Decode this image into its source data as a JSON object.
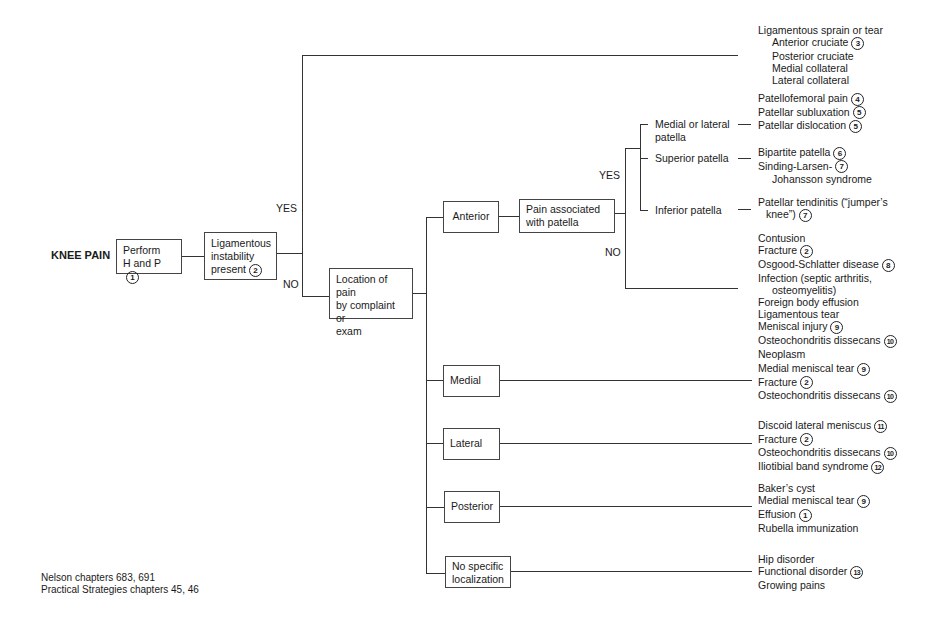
{
  "title": "KNEE PAIN",
  "start_box": {
    "text": [
      "Perform",
      "H and P"
    ],
    "ref": "1"
  },
  "decision_box": {
    "text": [
      "Ligamentous",
      "instability",
      "present"
    ],
    "ref": "2"
  },
  "branch_labels": {
    "yes": "YES",
    "no": "NO",
    "patella_yes": "YES",
    "patella_no": "NO"
  },
  "yes_outcome": {
    "heading": "Ligamentous sprain or tear",
    "items": [
      {
        "text": "Anterior cruciate",
        "ref": "3"
      },
      {
        "text": "Posterior cruciate",
        "ref": ""
      },
      {
        "text": "Medial collateral",
        "ref": ""
      },
      {
        "text": "Lateral collateral",
        "ref": ""
      }
    ]
  },
  "location_box": {
    "text": [
      "Location of pain",
      "by complaint or",
      "exam"
    ]
  },
  "locations": {
    "anterior": {
      "label": "Anterior",
      "patella_box": [
        "Pain associated",
        "with patella"
      ],
      "patella_sites": [
        {
          "label": [
            "Medial or lateral",
            "patella"
          ],
          "dx": [
            {
              "text": "Patellofemoral pain",
              "ref": "4"
            },
            {
              "text": "Patellar subluxation",
              "ref": "5"
            },
            {
              "text": "Patellar dislocation",
              "ref": "5"
            }
          ]
        },
        {
          "label": [
            "Superior patella"
          ],
          "dx": [
            {
              "text": "Bipartite patella",
              "ref": "6"
            },
            {
              "text": "Sinding-Larsen-",
              "ref": "7"
            },
            {
              "text": "Johansson syndrome",
              "ref": ""
            }
          ]
        },
        {
          "label": [
            "Inferior patella"
          ],
          "dx": [
            {
              "text": "Patellar tendinitis (“jumper’s",
              "ref": ""
            },
            {
              "text": "knee”)",
              "ref": "7"
            }
          ]
        }
      ],
      "non_patella_dx": [
        {
          "text": "Contusion",
          "ref": ""
        },
        {
          "text": "Fracture",
          "ref": "2"
        },
        {
          "text": "Osgood-Schlatter disease",
          "ref": "8"
        },
        {
          "text": "Infection (septic arthritis,",
          "ref": ""
        },
        {
          "text": "osteomyelitis)",
          "ref": ""
        },
        {
          "text": "Foreign body effusion",
          "ref": ""
        },
        {
          "text": "Ligamentous tear",
          "ref": ""
        },
        {
          "text": "Meniscal injury",
          "ref": "9"
        },
        {
          "text": "Osteochondritis dissecans",
          "ref": "10"
        },
        {
          "text": "Neoplasm",
          "ref": ""
        }
      ]
    },
    "medial": {
      "label": "Medial",
      "dx": [
        {
          "text": "Medial meniscal tear",
          "ref": "9"
        },
        {
          "text": "Fracture",
          "ref": "2"
        },
        {
          "text": "Osteochondritis dissecans",
          "ref": "10"
        }
      ]
    },
    "lateral": {
      "label": "Lateral",
      "dx": [
        {
          "text": "Discoid lateral meniscus",
          "ref": "11"
        },
        {
          "text": "Fracture",
          "ref": "2"
        },
        {
          "text": "Osteochondritis dissecans",
          "ref": "10"
        },
        {
          "text": "Iliotibial band syndrome",
          "ref": "12"
        }
      ]
    },
    "posterior": {
      "label": "Posterior",
      "dx": [
        {
          "text": "Baker’s cyst",
          "ref": ""
        },
        {
          "text": "Medial meniscal tear",
          "ref": "9"
        },
        {
          "text": "Effusion",
          "ref": "1"
        },
        {
          "text": "Rubella immunization",
          "ref": ""
        }
      ]
    },
    "nonspecific": {
      "label": [
        "No specific",
        "localization"
      ],
      "dx": [
        {
          "text": "Hip disorder",
          "ref": ""
        },
        {
          "text": "Functional disorder",
          "ref": "13"
        },
        {
          "text": "Growing pains",
          "ref": ""
        }
      ]
    }
  },
  "references": [
    "Nelson chapters 683, 691",
    "Practical Strategies chapters 45, 46"
  ]
}
